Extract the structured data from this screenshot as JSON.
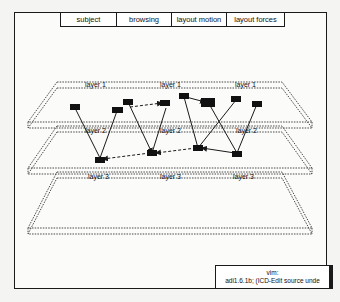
{
  "tabs": [
    {
      "label": "subject",
      "width": 56
    },
    {
      "label": "browsing",
      "width": 55
    },
    {
      "label": "layout motion",
      "width": 55
    },
    {
      "label": "layout forces",
      "width": 57
    }
  ],
  "layers": [
    {
      "name": "layer 1",
      "labels": [
        "layer 1",
        "layer 1",
        "layer 1"
      ]
    },
    {
      "name": "layer 2",
      "labels": [
        "layer 2",
        "layer 2",
        "layer 2"
      ]
    },
    {
      "name": "layer 3",
      "labels": [
        "layer 3",
        "layer 3",
        "layer 3"
      ]
    }
  ],
  "status": {
    "line1": "vim:",
    "line2": "adi1.6.1b; (ICD-Edit source unde"
  },
  "colors": {
    "ink": "#1a1a1a",
    "background": "#fbfbfa"
  }
}
